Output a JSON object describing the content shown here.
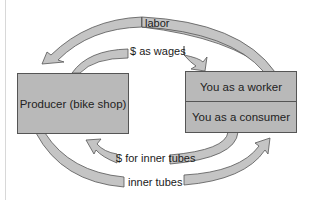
{
  "diagram": {
    "nodes": {
      "producer": "Producer (bike shop)",
      "worker": "You as a worker",
      "consumer": "You as a consumer"
    },
    "flows": {
      "labor": "labor",
      "wages": "$ as wages",
      "money_inner_tubes": "$ for inner tubes",
      "inner_tubes": "inner tubes"
    },
    "colors": {
      "box_fill": "#b9b9b9",
      "arrow_fill": "#c4c4c4",
      "stroke": "#555555"
    }
  }
}
